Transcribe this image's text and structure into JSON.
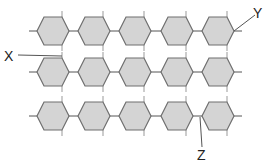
{
  "diagram": {
    "type": "polymer-chains",
    "rows": 3,
    "units_per_row": 5,
    "unit_shape": "hexagon",
    "colors": {
      "fill": "#d4d4d4",
      "stroke": "#6f6f6f",
      "line": "#555555",
      "text": "#222222"
    },
    "labels": [
      {
        "id": "X",
        "text": "X",
        "points_to": "bond between chains (row 1 to row 2, between unit 1 and 2)"
      },
      {
        "id": "Y",
        "text": "Y",
        "points_to": "monomer unit (row 1, unit 5)"
      },
      {
        "id": "Z",
        "text": "Z",
        "points_to": "linkage between units (row 3, between unit 4 and 5)"
      }
    ]
  }
}
